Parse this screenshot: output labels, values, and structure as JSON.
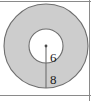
{
  "figure": {
    "type": "annulus-diagram",
    "colors": {
      "ring_fill": "#cdcdcd",
      "inner_fill": "#ffffff",
      "stroke": "#6e6e6e",
      "frame_stroke": "#8a8a8a",
      "label_color": "#1a1a1a",
      "background": "#ffffff"
    },
    "geometry": {
      "center_x": 46,
      "center_y": 46,
      "outer_radius": 42,
      "inner_radius": 17,
      "clip_bottom_y": 94
    },
    "labels": {
      "inner_radius_value": "6",
      "outer_radius_value": "8"
    },
    "label_positions": {
      "inner": {
        "x": 50,
        "y": 59
      },
      "outer": {
        "x": 50,
        "y": 81
      }
    },
    "frame": {
      "top_line_y": 1,
      "right_line_x": 90,
      "bottom_line_y": 95
    }
  }
}
